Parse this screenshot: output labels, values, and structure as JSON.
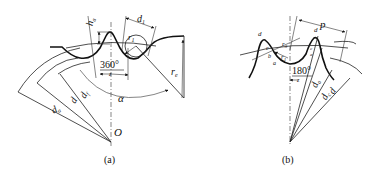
{
  "figure_a": {
    "caption": "(a)",
    "labels": {
      "ha": "h",
      "ha_sub": "a",
      "d1": "d",
      "d1_sub": "1",
      "r1": "r",
      "r1_sub": "1",
      "angle": "360°",
      "angle_den": "z",
      "alpha": "α",
      "re": "r",
      "re_sub": "e",
      "da": "d",
      "da_sub": "a",
      "d": "d",
      "df": "d",
      "df_sub": "f",
      "center": "O"
    }
  },
  "figure_b": {
    "caption": "(b)",
    "labels": {
      "p": "p",
      "angle": "180°",
      "angle_den": "z",
      "da": "d",
      "da_sub": "a",
      "dc": "d",
      "dc_sub": "c",
      "d": "d",
      "r3": "r",
      "r3_sub": "3",
      "r1": "r",
      "r1_sub": "1",
      "pt_a": "a",
      "pt_b": "b",
      "pt_c": "c",
      "pt_d": "d",
      "pt_d1": "d",
      "pt_c2": "c",
      "pt_a2": "a"
    }
  }
}
